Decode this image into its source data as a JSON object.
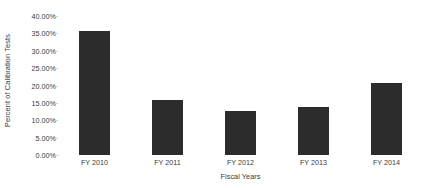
{
  "chart_data": {
    "type": "bar",
    "title": "",
    "categories": [
      "FY 2010",
      "FY 2011",
      "FY 2012",
      "FY 2013",
      "FY 2014"
    ],
    "values": [
      35.6,
      15.8,
      12.6,
      13.8,
      20.8
    ],
    "value_labels": [
      "35.60%",
      "15.80%",
      "12.60%",
      "13.80%",
      "20.80%"
    ],
    "xlabel": "Fiscal Years",
    "ylabel": "Percent of Calibration Tests",
    "ylim": [
      0,
      40
    ],
    "ytick_values": [
      0,
      5,
      10,
      15,
      20,
      25,
      30,
      35,
      40
    ],
    "ytick_labels": [
      "0.00%",
      "5.00%",
      "10.00%",
      "15.00%",
      "20.00%",
      "25.00%",
      "30.00%",
      "35.00%",
      "40.00%"
    ],
    "grid": false,
    "legend": "none",
    "series_color": "#2c2c2c",
    "background_color": "#ffffff",
    "text_color": "#3a3a3a"
  }
}
